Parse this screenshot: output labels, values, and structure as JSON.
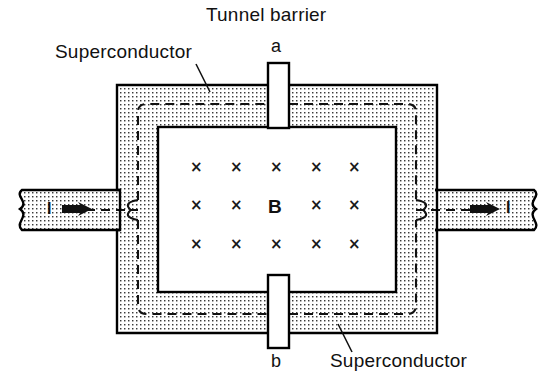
{
  "figure": {
    "title": "Tunnel barrier",
    "background": "#ffffff",
    "ink_color": "#000000",
    "stipple_color": "#2b2b2b",
    "width": 560,
    "height": 383
  },
  "labels": {
    "tunnel_barrier": "Tunnel barrier",
    "superconductor_top": "Superconductor",
    "superconductor_bottom": "Superconductor",
    "junction_a": "a",
    "junction_b": "b",
    "current_in": "I",
    "current_out": "I",
    "field_symbol": "B"
  },
  "field": {
    "symbol": "B",
    "direction": "into-page",
    "marker": "×",
    "columns_x": [
      195,
      235,
      275,
      315,
      353
    ],
    "rows_y": [
      168,
      206,
      245
    ],
    "center_replaced_by_symbol": true,
    "marks": [
      {
        "x": 195,
        "y": 168,
        "glyph": "×"
      },
      {
        "x": 235,
        "y": 168,
        "glyph": "×"
      },
      {
        "x": 275,
        "y": 168,
        "glyph": "×"
      },
      {
        "x": 315,
        "y": 168,
        "glyph": "×"
      },
      {
        "x": 353,
        "y": 168,
        "glyph": "×"
      },
      {
        "x": 195,
        "y": 206,
        "glyph": "×"
      },
      {
        "x": 235,
        "y": 206,
        "glyph": "×"
      },
      {
        "x": 315,
        "y": 206,
        "glyph": "×"
      },
      {
        "x": 353,
        "y": 206,
        "glyph": "×"
      },
      {
        "x": 195,
        "y": 245,
        "glyph": "×"
      },
      {
        "x": 235,
        "y": 245,
        "glyph": "×"
      },
      {
        "x": 275,
        "y": 245,
        "glyph": "×"
      },
      {
        "x": 315,
        "y": 245,
        "glyph": "×"
      },
      {
        "x": 353,
        "y": 245,
        "glyph": "×"
      }
    ]
  },
  "geometry": {
    "outer_ring": {
      "x": 117,
      "y": 85,
      "w": 320,
      "h": 248
    },
    "inner_hole": {
      "x": 158,
      "y": 127,
      "w": 238,
      "h": 165
    },
    "left_lead": {
      "x": 14,
      "y": 190,
      "w": 104,
      "h": 40
    },
    "right_lead": {
      "x": 436,
      "y": 190,
      "w": 110,
      "h": 40
    },
    "barrier_top": {
      "x": 268,
      "y": 63,
      "w": 21,
      "h": 65
    },
    "barrier_bottom": {
      "x": 268,
      "y": 275,
      "w": 21,
      "h": 73
    },
    "contour_dashed": true
  },
  "annotations": {
    "leader_top": {
      "x1": 196,
      "y1": 64,
      "x2": 210,
      "y2": 92
    },
    "leader_bottom": {
      "x1": 352,
      "y1": 352,
      "x2": 338,
      "y2": 324
    }
  }
}
